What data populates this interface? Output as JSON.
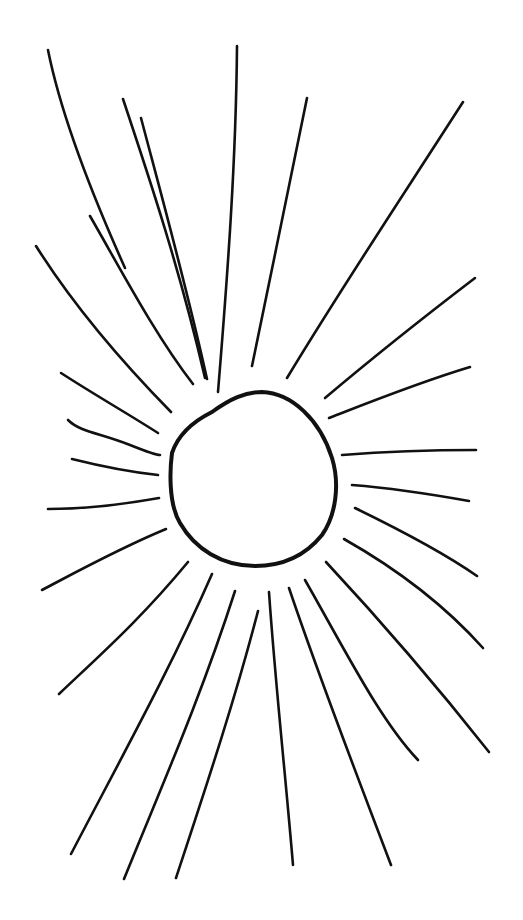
{
  "image": {
    "subject": "Hand-drawn sun",
    "description": "Black ink line drawing of a sun: an irregular circle with many straight radiating rays on a white background",
    "background_color": "#ffffff",
    "ink_color": "#111111"
  },
  "sun": {
    "center": [
      253,
      478
    ],
    "disc_path": "M 212 412 C 230 399, 245 392, 262 392 C 292 393, 320 420, 332 458 C 340 484, 336 515, 322 535 C 305 556, 282 566, 255 566 C 222 566, 195 549, 180 523 C 168 503, 170 468, 172 453 C 177 438, 190 423, 212 412 Z",
    "rays": [
      {
        "d": "M 48 50 C 60 110, 90 190, 125 268"
      },
      {
        "d": "M 90 216 C 120 268, 155 335, 193 384"
      },
      {
        "d": "M 123 99 C 150 180, 180 270, 205 378"
      },
      {
        "d": "M 141 118 C 160 190, 185 280, 207 379"
      },
      {
        "d": "M 237 46 C 236 160, 228 270, 218 392"
      },
      {
        "d": "M 307 98 C 290 180, 270 280, 252 366"
      },
      {
        "d": "M 463 102 C 400 200, 340 290, 287 378"
      },
      {
        "d": "M 36 246 C 70 300, 120 360, 171 412"
      },
      {
        "d": "M 61 373 C 95 395, 130 415, 158 433"
      },
      {
        "d": "M 68 420 C 80 432, 100 433, 130 445 C 145 451, 155 455, 160 455"
      },
      {
        "d": "M 72 459 C 100 466, 130 472, 158 475"
      },
      {
        "d": "M 48 509 C 80 509, 120 505, 159 498"
      },
      {
        "d": "M 42 590 C 80 570, 120 548, 166 529"
      },
      {
        "d": "M 59 694 C 100 655, 140 620, 188 562"
      },
      {
        "d": "M 71 854 C 120 760, 170 670, 212 574"
      },
      {
        "d": "M 124 879 C 160 790, 200 700, 235 591"
      },
      {
        "d": "M 176 878 C 205 790, 235 700, 258 611"
      },
      {
        "d": "M 269 592 C 275 680, 285 770, 293 865"
      },
      {
        "d": "M 289 588 C 320 680, 355 770, 391 865"
      },
      {
        "d": "M 305 580 C 345 650, 380 720, 418 760"
      },
      {
        "d": "M 326 562 C 380 620, 440 690, 489 752"
      },
      {
        "d": "M 344 539 C 390 565, 440 600, 483 648"
      },
      {
        "d": "M 355 508 C 390 525, 440 550, 477 576"
      },
      {
        "d": "M 352 485 C 390 488, 430 494, 469 501"
      },
      {
        "d": "M 342 455 C 380 452, 430 450, 476 450"
      },
      {
        "d": "M 329 418 C 370 402, 420 382, 470 367"
      },
      {
        "d": "M 325 398 C 370 360, 420 320, 475 278"
      }
    ]
  }
}
